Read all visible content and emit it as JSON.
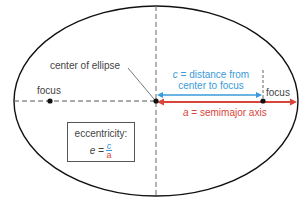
{
  "diagram": {
    "labels": {
      "center": "center of ellipse",
      "focus_left": "focus",
      "focus_right": "focus",
      "c_var": "c",
      "c_desc_line1": " = distance from",
      "c_desc_line2": "center to focus",
      "a_var": "a",
      "a_desc": " = semimajor axis"
    },
    "eccentricity_box": {
      "title": "eccentricity:",
      "lhs": "e =",
      "numerator": "c",
      "denominator": "a"
    },
    "colors": {
      "outline": "#111111",
      "dashed": "#555555",
      "c_arrow": "#3a9ad9",
      "a_arrow": "#d9453b",
      "text": "#444444"
    },
    "geometry": {
      "center": [
        156,
        101
      ],
      "rx": 142,
      "ry": 95,
      "focus_left": [
        50,
        101
      ],
      "focus_right": [
        263,
        101
      ]
    }
  }
}
